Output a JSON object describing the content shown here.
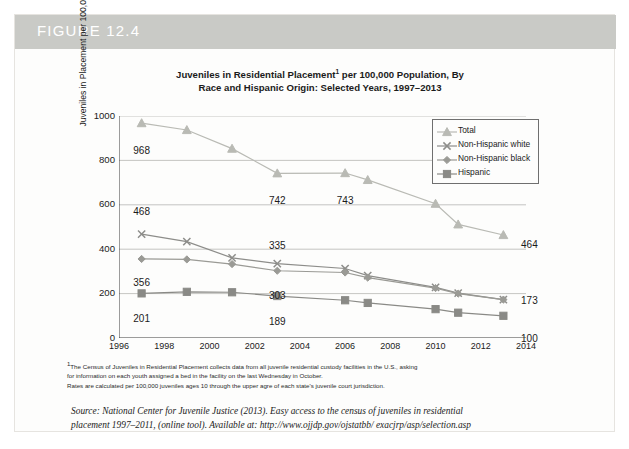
{
  "figure": {
    "label": "FIGURE 12.4",
    "band_color": "#c9cac6"
  },
  "chart_data": {
    "type": "line",
    "title_line1": "Juveniles in Residential Placement",
    "title_line1_sup": "1",
    "title_line1_rest": " per 100,000 Population, By",
    "title_line2": "Race and Hispanic Origin: Selected Years, 1997–2013",
    "xlabel": "",
    "ylabel": "Juveniles in Placement per 100,000 Population",
    "xlim": [
      1996,
      2014
    ],
    "ylim": [
      0,
      1000
    ],
    "xticks": [
      "1996",
      "1998",
      "2000",
      "2002",
      "2004",
      "2006",
      "2008",
      "2010",
      "2012",
      "2014"
    ],
    "xtick_values": [
      1996,
      1998,
      2000,
      2002,
      2004,
      2006,
      2008,
      2010,
      2012,
      2014
    ],
    "yticks": [
      "0",
      "200",
      "400",
      "600",
      "800",
      "1000"
    ],
    "ytick_values": [
      0,
      200,
      400,
      600,
      800,
      1000
    ],
    "grid": true,
    "legend_position": "upper right",
    "x": [
      1997,
      1999,
      2001,
      2003,
      2006,
      2007,
      2010,
      2011,
      2013
    ],
    "series": [
      {
        "name": "Total",
        "marker": "triangle",
        "color": "#b9bab4",
        "values": [
          968,
          937,
          853,
          742,
          743,
          712,
          605,
          512,
          464
        ],
        "label_first": "968",
        "label_last": "464"
      },
      {
        "name": "Non-Hispanic white",
        "marker": "cross",
        "color": "#8d8d8a",
        "values": [
          468,
          434,
          361,
          335,
          313,
          281,
          228,
          202,
          173
        ],
        "label_first": "468",
        "label_last": "173"
      },
      {
        "name": "Non-Hispanic black",
        "marker": "diamond",
        "color": "#9a9a95",
        "values": [
          356,
          354,
          333,
          303,
          295,
          272,
          225,
          200,
          173
        ],
        "label_first": "356",
        "label_last": ""
      },
      {
        "name": "Hispanic",
        "marker": "square",
        "color": "#8a8a86",
        "values": [
          201,
          208,
          206,
          189,
          170,
          158,
          130,
          114,
          100
        ],
        "label_first": "201",
        "label_last": "100"
      }
    ],
    "annotations": [
      {
        "text": "968",
        "x": 1997,
        "y": 968,
        "dx": 0,
        "dy": 28
      },
      {
        "text": "742",
        "x": 2003,
        "y": 742,
        "dx": 0,
        "dy": 28
      },
      {
        "text": "743",
        "x": 2006,
        "y": 743,
        "dx": 0,
        "dy": 28
      },
      {
        "text": "464",
        "x": 2013,
        "y": 464,
        "dx": 26,
        "dy": 10
      },
      {
        "text": "468",
        "x": 1997,
        "y": 468,
        "dx": 0,
        "dy": -22
      },
      {
        "text": "335",
        "x": 2003,
        "y": 335,
        "dx": 0,
        "dy": -18
      },
      {
        "text": "173",
        "x": 2013,
        "y": 173,
        "dx": 26,
        "dy": 1
      },
      {
        "text": "356",
        "x": 1997,
        "y": 356,
        "dx": 0,
        "dy": 24
      },
      {
        "text": "303",
        "x": 2003,
        "y": 303,
        "dx": 0,
        "dy": 25
      },
      {
        "text": "201",
        "x": 1997,
        "y": 201,
        "dx": 0,
        "dy": 26
      },
      {
        "text": "189",
        "x": 2003,
        "y": 189,
        "dx": 0,
        "dy": 26
      },
      {
        "text": "100",
        "x": 2013,
        "y": 100,
        "dx": 26,
        "dy": 23
      }
    ]
  },
  "footnote": {
    "sup": "1",
    "line1": "The Census of Juveniles in Residential Placement collects data from all juvenile residential custody facilities in the U.S., asking",
    "line2": "for information on each youth assigned a bed in the facility on the last Wednesday in October.",
    "line3": "Rates are calculated per 100,000 juveniles ages 10 through the upper agre of each state's juvenile court jurisdiction."
  },
  "source": {
    "line1": "Source: National Center for Juvenile Justice (2013). Easy access to the census of juveniles in residential",
    "line2": "placement 1997–2011, (online tool). Available at: http://www.ojjdp.gov/ojstatbb/ exacjrp/asp/selection.asp"
  }
}
